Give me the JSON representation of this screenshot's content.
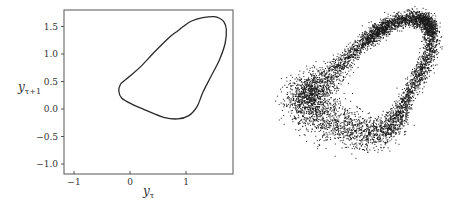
{
  "chart_data": [
    {
      "type": "line",
      "title": "",
      "xlabel": "y_τ",
      "ylabel": "y_τ+1",
      "xlabel_parts": {
        "base": "y",
        "sub": "τ"
      },
      "ylabel_parts": {
        "base": "y",
        "sub": "τ+1"
      },
      "xlim": [
        -1.2,
        1.85
      ],
      "ylim": [
        -1.15,
        1.8
      ],
      "xticks": [
        -1,
        0,
        1
      ],
      "xtick_labels": [
        "−1",
        "0",
        "1"
      ],
      "yticks": [
        -1.0,
        -0.5,
        0.0,
        0.5,
        1.0,
        1.5
      ],
      "ytick_labels": [
        "−1.0",
        "−0.5",
        "0.0",
        "0.5",
        "1.0",
        "1.5"
      ],
      "grid": false,
      "legend": null,
      "series": [
        {
          "name": "closed orbit",
          "closed": true,
          "x": [
            -0.17,
            -0.12,
            0.0,
            0.2,
            0.45,
            0.7,
            0.85,
            0.95,
            1.1,
            1.3,
            1.5,
            1.6,
            1.68,
            1.72,
            1.7,
            1.6,
            1.45,
            1.3,
            1.2,
            1.05,
            0.85,
            0.6,
            0.3,
            0.05,
            -0.15,
            -0.2
          ],
          "y": [
            0.45,
            0.5,
            0.6,
            0.78,
            1.05,
            1.3,
            1.42,
            1.5,
            1.6,
            1.66,
            1.68,
            1.65,
            1.58,
            1.45,
            1.2,
            0.9,
            0.6,
            0.3,
            0.05,
            -0.12,
            -0.18,
            -0.15,
            -0.03,
            0.08,
            0.2,
            0.33
          ]
        }
      ]
    },
    {
      "type": "scatter",
      "title": "",
      "axes_visible": false,
      "description": "Noisy scatter of the same attractor: dense dark band along the upper-right rim, sparser cloud toward lower-left",
      "approx_point_count": 6000,
      "series": [
        {
          "name": "noisy samples",
          "center_shape": "rotated crescent/ellipse",
          "bbox_px": [
            268,
            10,
            442,
            185
          ]
        }
      ]
    }
  ],
  "colors": {
    "line": "#2a2a2a",
    "points": "#1a1a1a",
    "frame": "#555555"
  }
}
